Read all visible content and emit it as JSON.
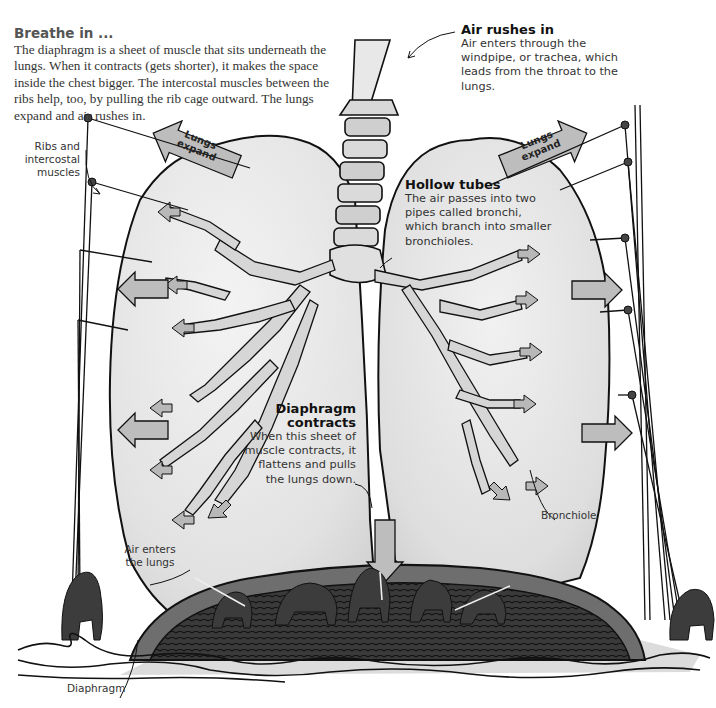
{
  "intro": {
    "title": "Breathe in ...",
    "body": "The diaphragm is a sheet of muscle that sits underneath the lungs. When it contracts (gets shorter), it makes the space inside the chest bigger. The intercostal muscles between the ribs help, too, by pulling the rib cage outward. The lungs expand and air rushes in."
  },
  "callouts": {
    "air_rushes_in": {
      "title": "Air rushes in",
      "body": "Air enters through the windpipe, or trachea, which leads from the throat to the lungs."
    },
    "hollow_tubes": {
      "title": "Hollow tubes",
      "body": "The air passes into two pipes called bronchi, which branch into smaller bronchioles."
    },
    "diaphragm_contracts": {
      "title_line1": "Diaphragm",
      "title_line2": "contracts",
      "body_lines": [
        "When this sheet of",
        "muscle contracts, it",
        "flattens and pulls",
        "the lungs down."
      ]
    }
  },
  "labels": {
    "ribs_line1": "Ribs and",
    "ribs_line2": "intercostal",
    "ribs_line3": "muscles",
    "air_enters_line1": "Air enters",
    "air_enters_line2": "the lungs",
    "bronchiole": "Bronchiole",
    "diaphragm": "Diaphragm",
    "lungs_expand_left_1": "Lungs",
    "lungs_expand_left_2": "expand",
    "lungs_expand_right_1": "Lungs",
    "lungs_expand_right_2": "expand"
  },
  "colors": {
    "lung_fill": "#e6e6e6",
    "arrow_fill": "#bdbdbd",
    "diaphragm_dark": "#3a3a3a",
    "diaphragm_rim": "#6e6e6e",
    "floor": "#d9d9d9",
    "text_serif": "#333333"
  }
}
